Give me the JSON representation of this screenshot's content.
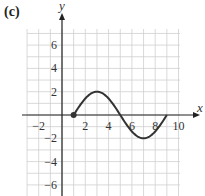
{
  "panel_label": "(c)",
  "chart_data": {
    "type": "line",
    "title": "",
    "xlabel": "x",
    "ylabel": "y",
    "xlim": [
      -3,
      10
    ],
    "ylim": [
      -7,
      7
    ],
    "grid": true,
    "x_ticks": [
      -2,
      2,
      4,
      6,
      8,
      10
    ],
    "y_ticks": [
      6,
      4,
      2,
      -2,
      -4,
      -6
    ],
    "series": [
      {
        "name": "curve",
        "description": "sinusoid y = 2 sin(pi(x-1)/4) for 1 <= x <= 9",
        "x": [
          1,
          2,
          3,
          4,
          5,
          6,
          7,
          8,
          9
        ],
        "y": [
          0,
          1.41,
          2,
          1.41,
          0,
          -1.41,
          -2,
          -1.41,
          0
        ],
        "start_marker": {
          "x": 1,
          "y": 0,
          "style": "filled-dot"
        }
      }
    ],
    "colors": {
      "curve": "#333333",
      "grid": "#cfcfcf",
      "axis": "#222222"
    }
  }
}
